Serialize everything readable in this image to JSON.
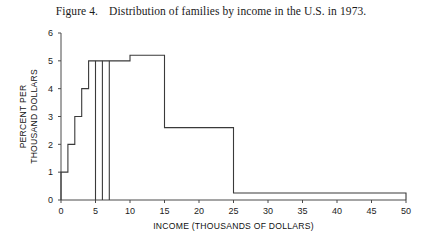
{
  "figure": {
    "label": "Figure 4.",
    "caption": "Distribution of families by income in the U.S. in 1973."
  },
  "chart_data": {
    "type": "bar",
    "title": "Distribution of families by income in the U.S. in 1973.",
    "xlabel": "INCOME (THOUSANDS OF DOLLARS)",
    "ylabel": "PERCENT PER THOUSAND DOLLARS",
    "xlim": [
      0,
      50
    ],
    "ylim": [
      0,
      6
    ],
    "xticks": [
      0,
      5,
      10,
      15,
      20,
      25,
      30,
      35,
      40,
      45,
      50
    ],
    "xticklabels": [
      "0",
      "5",
      "10",
      "15",
      "20",
      "25",
      "30",
      "35",
      "40",
      "45",
      "50"
    ],
    "yticks": [
      0,
      1,
      2,
      3,
      4,
      5,
      6
    ],
    "yticklabels": [
      "0",
      "1",
      "2",
      "3",
      "4",
      "5",
      "6"
    ],
    "grid": false,
    "legend": false,
    "bin_edges": [
      0,
      1,
      2,
      3,
      4,
      5,
      6,
      7,
      10,
      15,
      25,
      50
    ],
    "values": [
      1.0,
      2.0,
      3.0,
      4.0,
      5.0,
      5.0,
      5.0,
      5.0,
      5.2,
      2.6,
      0.25
    ],
    "categories": [
      "0-1",
      "1-2",
      "2-3",
      "3-4",
      "4-5",
      "5-6",
      "6-7",
      "7-10",
      "10-15",
      "15-25",
      "25-50"
    ],
    "bars": [
      {
        "from": 0,
        "to": 1,
        "height": 1.0
      },
      {
        "from": 1,
        "to": 2,
        "height": 2.0
      },
      {
        "from": 2,
        "to": 3,
        "height": 3.0
      },
      {
        "from": 3,
        "to": 4,
        "height": 4.0
      },
      {
        "from": 4,
        "to": 5,
        "height": 5.0
      },
      {
        "from": 5,
        "to": 6,
        "height": 5.0
      },
      {
        "from": 6,
        "to": 7,
        "height": 5.0
      },
      {
        "from": 7,
        "to": 10,
        "height": 5.0
      },
      {
        "from": 10,
        "to": 15,
        "height": 5.2
      },
      {
        "from": 15,
        "to": 25,
        "height": 2.6
      },
      {
        "from": 25,
        "to": 50,
        "height": 0.25
      }
    ],
    "colors": {
      "line": "#3a3a3a",
      "axis": "#4a4a4a",
      "background": "#ffffff"
    }
  }
}
